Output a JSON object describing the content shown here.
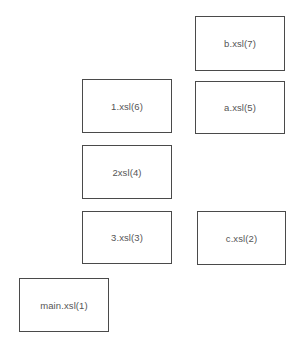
{
  "diagram": {
    "boxes": [
      {
        "id": "b",
        "label": "b.xsl(7)",
        "x": 195,
        "y": 16,
        "w": 90,
        "h": 55
      },
      {
        "id": "one",
        "label": "1.xsl(6)",
        "x": 82,
        "y": 79,
        "w": 90,
        "h": 54
      },
      {
        "id": "a",
        "label": "a.xsl(5)",
        "x": 195,
        "y": 81,
        "w": 90,
        "h": 53
      },
      {
        "id": "two",
        "label": "2xsl(4)",
        "x": 82,
        "y": 145,
        "w": 90,
        "h": 54
      },
      {
        "id": "three",
        "label": "3.xsl(3)",
        "x": 82,
        "y": 211,
        "w": 90,
        "h": 53
      },
      {
        "id": "c",
        "label": "c.xsl(2)",
        "x": 197,
        "y": 211,
        "w": 89,
        "h": 54
      },
      {
        "id": "main",
        "label": "main.xsl(1)",
        "x": 19,
        "y": 278,
        "w": 90,
        "h": 54
      }
    ],
    "colors": {
      "border": "#4a4a4a",
      "text": "#555555",
      "background": "#ffffff"
    }
  }
}
